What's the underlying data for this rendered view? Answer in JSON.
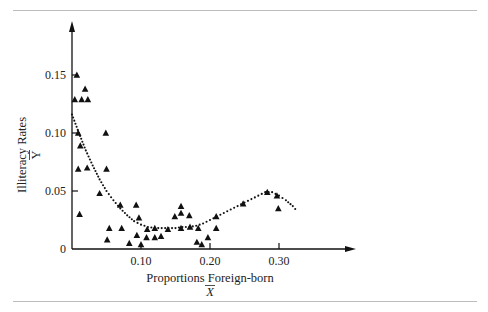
{
  "chart_data": {
    "type": "scatter",
    "title": "",
    "xlabel": "Proportions Foreign-born",
    "xlabel_symbol": "X",
    "ylabel": "Illiteracy Rates",
    "ylabel_symbol": "Y",
    "xlim": [
      0,
      0.35
    ],
    "ylim": [
      0,
      0.17
    ],
    "x_ticks": [
      {
        "value": 0.1,
        "label": "0.10"
      },
      {
        "value": 0.2,
        "label": "0.20"
      },
      {
        "value": 0.3,
        "label": "0.30"
      }
    ],
    "y_ticks": [
      {
        "value": 0,
        "label": "0"
      },
      {
        "value": 0.05,
        "label": "0.05"
      },
      {
        "value": 0.1,
        "label": "0.10"
      },
      {
        "value": 0.15,
        "label": "0.15"
      }
    ],
    "grid": false,
    "marker": "triangle",
    "points": [
      [
        0.007,
        0.15
      ],
      [
        0.019,
        0.138
      ],
      [
        0.004,
        0.129
      ],
      [
        0.014,
        0.129
      ],
      [
        0.023,
        0.129
      ],
      [
        0.009,
        0.1
      ],
      [
        0.049,
        0.1
      ],
      [
        0.012,
        0.089
      ],
      [
        0.009,
        0.069
      ],
      [
        0.022,
        0.07
      ],
      [
        0.05,
        0.069
      ],
      [
        0.04,
        0.048
      ],
      [
        0.011,
        0.03
      ],
      [
        0.07,
        0.038
      ],
      [
        0.093,
        0.038
      ],
      [
        0.097,
        0.027
      ],
      [
        0.054,
        0.018
      ],
      [
        0.072,
        0.018
      ],
      [
        0.051,
        0.008
      ],
      [
        0.094,
        0.012
      ],
      [
        0.083,
        0.005
      ],
      [
        0.1,
        0.004
      ],
      [
        0.109,
        0.017
      ],
      [
        0.12,
        0.018
      ],
      [
        0.108,
        0.01
      ],
      [
        0.12,
        0.01
      ],
      [
        0.129,
        0.011
      ],
      [
        0.139,
        0.017
      ],
      [
        0.149,
        0.028
      ],
      [
        0.158,
        0.037
      ],
      [
        0.158,
        0.031
      ],
      [
        0.17,
        0.029
      ],
      [
        0.158,
        0.018
      ],
      [
        0.171,
        0.019
      ],
      [
        0.183,
        0.018
      ],
      [
        0.181,
        0.006
      ],
      [
        0.188,
        0.004
      ],
      [
        0.197,
        0.01
      ],
      [
        0.209,
        0.028
      ],
      [
        0.209,
        0.018
      ],
      [
        0.248,
        0.039
      ],
      [
        0.283,
        0.049
      ],
      [
        0.297,
        0.046
      ],
      [
        0.299,
        0.035
      ]
    ],
    "smooth_curve": {
      "style": "dotted",
      "points": [
        [
          0.0,
          0.116
        ],
        [
          0.01,
          0.1
        ],
        [
          0.02,
          0.085
        ],
        [
          0.03,
          0.072
        ],
        [
          0.04,
          0.06
        ],
        [
          0.05,
          0.05
        ],
        [
          0.06,
          0.042
        ],
        [
          0.07,
          0.035
        ],
        [
          0.08,
          0.029
        ],
        [
          0.09,
          0.024
        ],
        [
          0.1,
          0.021
        ],
        [
          0.11,
          0.019
        ],
        [
          0.12,
          0.018
        ],
        [
          0.13,
          0.018
        ],
        [
          0.14,
          0.018
        ],
        [
          0.15,
          0.018
        ],
        [
          0.16,
          0.019
        ],
        [
          0.17,
          0.019
        ],
        [
          0.18,
          0.02
        ],
        [
          0.19,
          0.022
        ],
        [
          0.2,
          0.025
        ],
        [
          0.21,
          0.028
        ],
        [
          0.22,
          0.031
        ],
        [
          0.23,
          0.034
        ],
        [
          0.24,
          0.037
        ],
        [
          0.25,
          0.04
        ],
        [
          0.26,
          0.043
        ],
        [
          0.27,
          0.046
        ],
        [
          0.28,
          0.049
        ],
        [
          0.29,
          0.049
        ],
        [
          0.3,
          0.046
        ],
        [
          0.31,
          0.042
        ],
        [
          0.32,
          0.037
        ],
        [
          0.327,
          0.032
        ]
      ]
    }
  }
}
